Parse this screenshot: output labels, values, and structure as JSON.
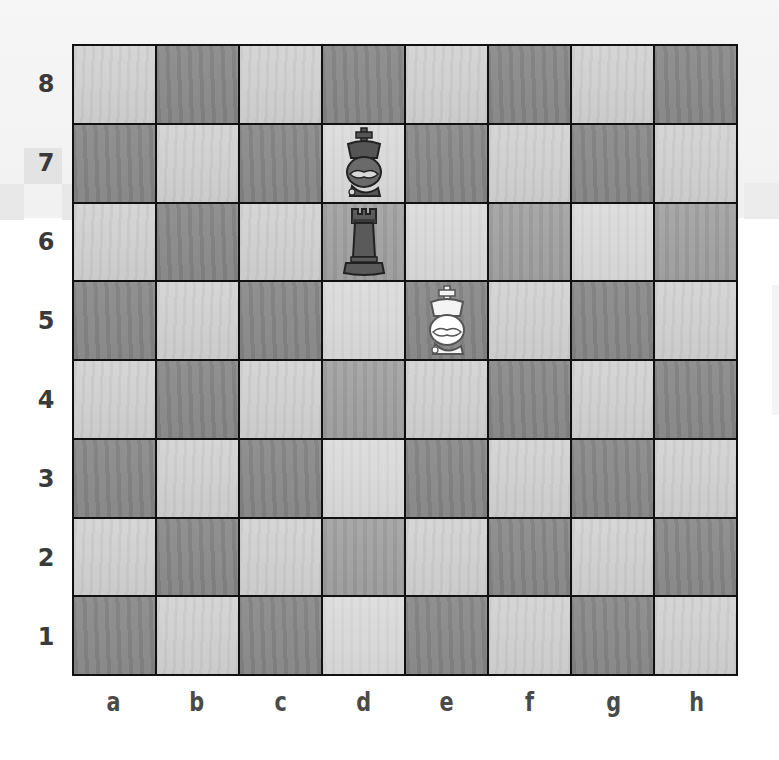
{
  "board": {
    "orientation": "white-bottom",
    "files": [
      "a",
      "b",
      "c",
      "d",
      "e",
      "f",
      "g",
      "h"
    ],
    "ranks": [
      "8",
      "7",
      "6",
      "5",
      "4",
      "3",
      "2",
      "1"
    ],
    "square_shades": [
      [
        "light",
        "dark",
        "light",
        "dark",
        "light",
        "dark",
        "light",
        "dark"
      ],
      [
        "dark",
        "light",
        "dark",
        "pale",
        "dark",
        "light",
        "dark",
        "light"
      ],
      [
        "light",
        "dark",
        "light",
        "medium",
        "pale",
        "medium",
        "pale",
        "medium"
      ],
      [
        "dark",
        "light",
        "dark",
        "pale",
        "dark",
        "light",
        "dark",
        "light"
      ],
      [
        "light",
        "dark",
        "light",
        "medium",
        "light",
        "dark",
        "light",
        "dark"
      ],
      [
        "dark",
        "light",
        "dark",
        "pale",
        "dark",
        "light",
        "dark",
        "light"
      ],
      [
        "light",
        "dark",
        "light",
        "medium",
        "light",
        "dark",
        "light",
        "dark"
      ],
      [
        "dark",
        "light",
        "dark",
        "pale",
        "dark",
        "light",
        "dark",
        "light"
      ]
    ],
    "pieces": [
      {
        "square": "d7",
        "color": "black",
        "type": "king",
        "glyph": "♚"
      },
      {
        "square": "d6",
        "color": "black",
        "type": "rook",
        "glyph": "♜"
      },
      {
        "square": "e5",
        "color": "white",
        "type": "king",
        "glyph": "♔"
      }
    ],
    "colors": {
      "light_square": "#cfcfcf",
      "dark_square": "#898989",
      "grid_line": "#111111",
      "label_text": "#3a3a3a"
    }
  }
}
